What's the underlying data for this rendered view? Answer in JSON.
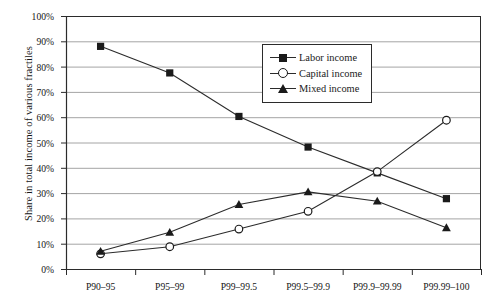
{
  "chart_data": {
    "type": "line",
    "title": "",
    "subtitle": "",
    "xlabel": "",
    "ylabel": "Share in total income of various fractiles",
    "categories": [
      "P90–95",
      "P95–99",
      "P99–99.5",
      "P99.5–99.9",
      "P99.9–99.99",
      "P99.99–100"
    ],
    "series": [
      {
        "name": "Labor income",
        "marker": "filled-square",
        "values": [
          88.0,
          77.5,
          60.3,
          48.2,
          38.0,
          27.8
        ]
      },
      {
        "name": "Capital income",
        "marker": "open-circle",
        "values": [
          6.0,
          8.8,
          15.8,
          22.8,
          38.5,
          58.8
        ]
      },
      {
        "name": "Mixed income",
        "marker": "filled-triangle",
        "values": [
          7.0,
          14.5,
          25.5,
          30.5,
          26.8,
          16.3
        ]
      }
    ],
    "ylim": [
      0,
      100
    ],
    "ytick_labels": [
      "100%",
      "90%",
      "80%",
      "70%",
      "60%",
      "50%",
      "40%",
      "30%",
      "20%",
      "10%",
      "0%"
    ],
    "ytick_values": [
      100,
      90,
      80,
      70,
      60,
      50,
      40,
      30,
      20,
      10,
      0
    ],
    "grid": "horizontal",
    "legend_position": "top-right-inside",
    "line_color": "#2b2b2b",
    "grid_color": "#9a9a9a",
    "axis_color": "#2b2b2b",
    "background": "#ffffff"
  },
  "legend": {
    "entries": [
      {
        "label": "Labor income",
        "icon": "filled-square-marker-icon"
      },
      {
        "label": "Capital income",
        "icon": "open-circle-marker-icon"
      },
      {
        "label": "Mixed income",
        "icon": "filled-triangle-marker-icon"
      }
    ]
  }
}
